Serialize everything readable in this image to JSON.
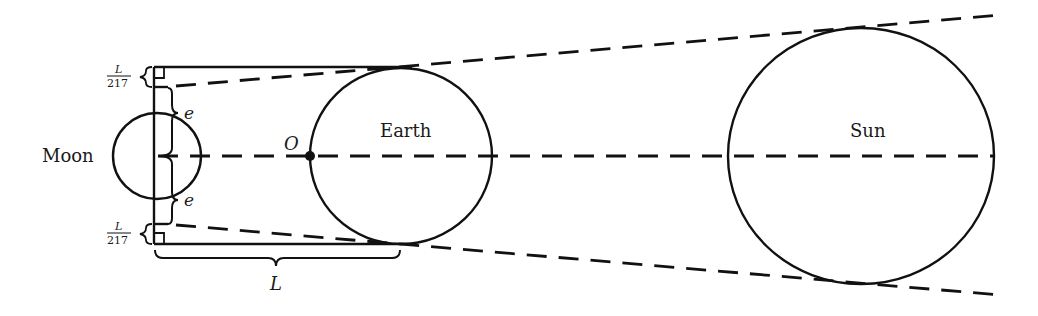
{
  "diagram": {
    "colors": {
      "stroke": "#111111",
      "background": "#ffffff",
      "text": "#1a1a1a"
    },
    "bodies": [
      {
        "id": "moon",
        "label": "Moon",
        "cx": 157,
        "cy": 156,
        "rx": 44,
        "ry": 43
      },
      {
        "id": "earth",
        "label": "Earth",
        "cx": 401,
        "cy": 156,
        "rx": 91,
        "ry": 88
      },
      {
        "id": "sun",
        "label": "Sun",
        "cx": 861,
        "cy": 156,
        "rx": 133,
        "ry": 128
      }
    ],
    "point_o": {
      "label": "O",
      "x": 310,
      "y": 156
    },
    "labels": {
      "moon": "Moon",
      "earth": "Earth",
      "sun": "Sun",
      "o": "O",
      "e_top": "e",
      "e_bottom": "e",
      "l_bottom": "L",
      "frac_top_num": "L",
      "frac_top_den": "217",
      "frac_bottom_num": "L",
      "frac_bottom_den": "217"
    }
  }
}
